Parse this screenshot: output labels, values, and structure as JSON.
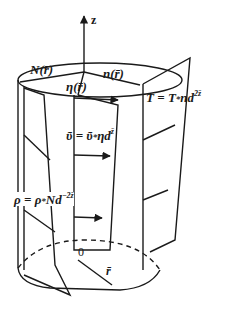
{
  "diagram": {
    "axis": {
      "label": "z"
    },
    "top_labels": {
      "N": "N(r̄)",
      "n": "n(r̄)",
      "eta": "η(r̄)"
    },
    "equations": {
      "T": {
        "lhs": "T",
        "eq": " = ",
        "base": "T",
        "star": "*",
        "rest": "nd",
        "exp": "2z̄"
      },
      "upsilon": {
        "lhs": "ῦ",
        "eq": " = ",
        "base": "ῦ",
        "star": "*",
        "rest": "ηd",
        "exp": "z̄"
      },
      "rho": {
        "lhs": "ρ",
        "eq": " = ",
        "base": "ρ",
        "star": "*",
        "rest": "Nd",
        "exp": "−2z̄"
      }
    },
    "bottom_labels": {
      "origin": "0",
      "radius": "r̄"
    },
    "colors": {
      "stroke": "#1a1a1a",
      "background": "#ffffff"
    }
  }
}
